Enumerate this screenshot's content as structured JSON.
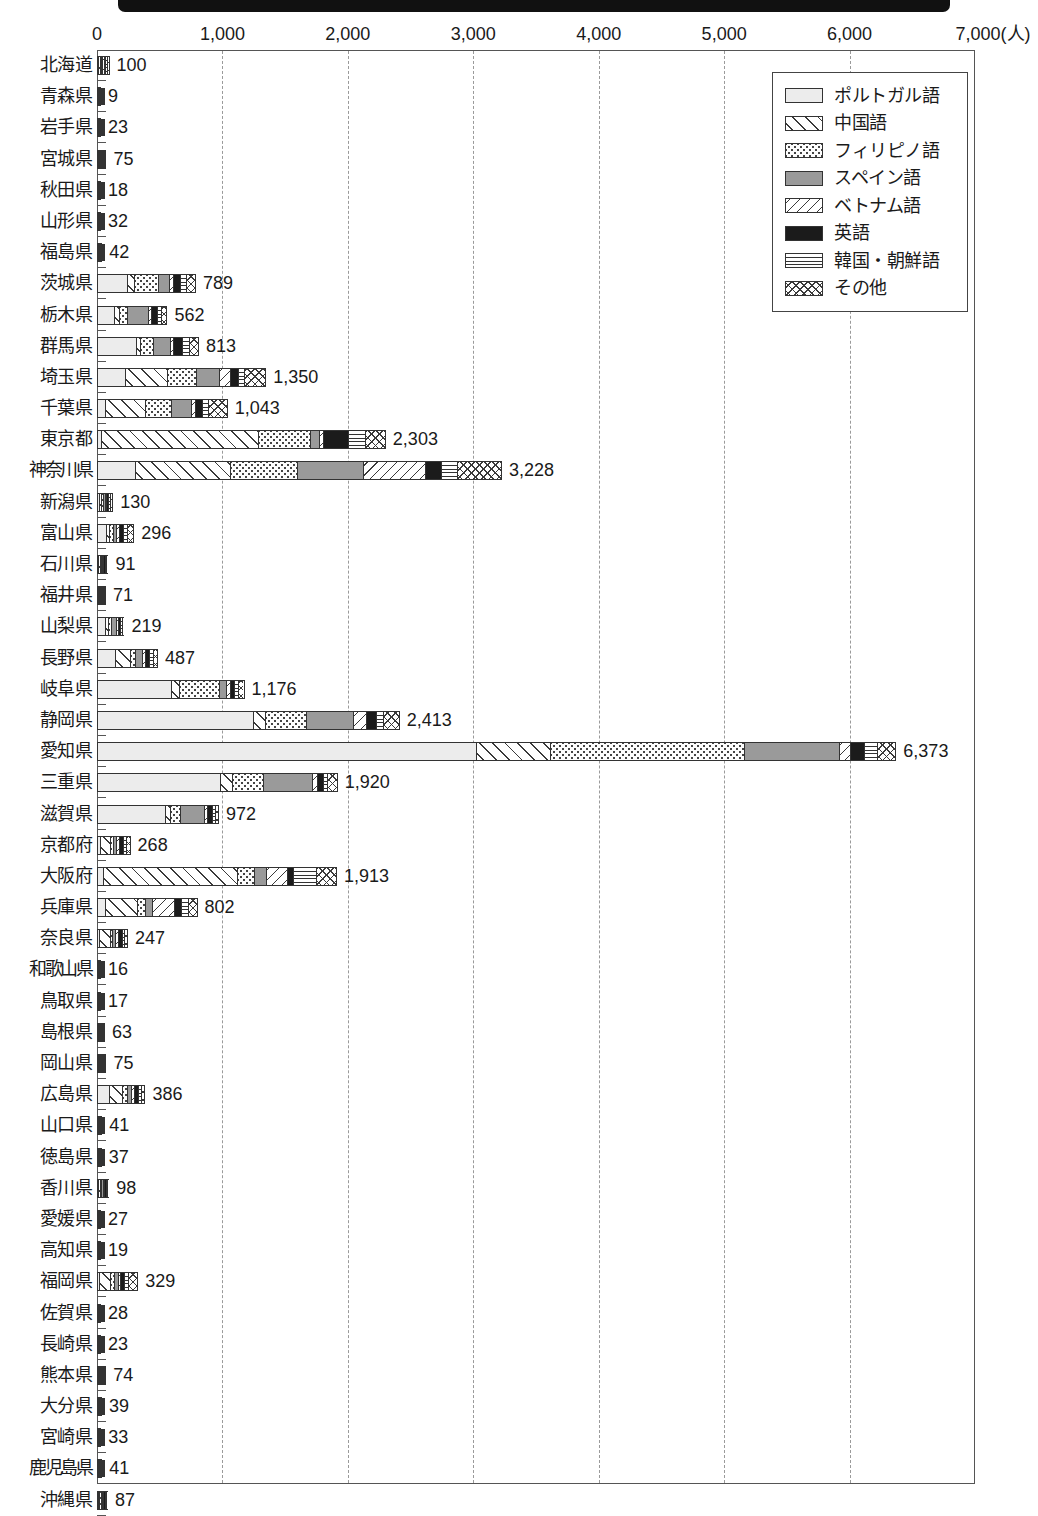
{
  "chart_data": {
    "type": "bar",
    "orientation": "horizontal",
    "stacked": true,
    "title": "",
    "xlabel": "(人)",
    "ylabel": "",
    "xlim": [
      0,
      7000
    ],
    "xticks": [
      0,
      1000,
      2000,
      3000,
      4000,
      5000,
      6000,
      7000
    ],
    "xtick_labels": [
      "0",
      "1,000",
      "2,000",
      "3,000",
      "4,000",
      "5,000",
      "6,000",
      "7,000"
    ],
    "unit_suffix": "(人)",
    "grid": "vertical-dashed",
    "legend_position": "top-right",
    "legend_entries": [
      "ポルトガル語",
      "中国語",
      "フィリピノ語",
      "スペイン語",
      "ベトナム語",
      "英語",
      "韓国・朝鮮語",
      "その他"
    ],
    "series": [
      {
        "key": "pt",
        "name": "ポルトガル語",
        "pattern": "light-gray-solid"
      },
      {
        "key": "zh",
        "name": "中国語",
        "pattern": "diagonal-hatch-up"
      },
      {
        "key": "ph",
        "name": "フィリピノ語",
        "pattern": "dotted"
      },
      {
        "key": "es",
        "name": "スペイン語",
        "pattern": "mid-gray-solid"
      },
      {
        "key": "vi",
        "name": "ベトナム語",
        "pattern": "diagonal-hatch-down"
      },
      {
        "key": "en",
        "name": "英語",
        "pattern": "black-solid"
      },
      {
        "key": "ko",
        "name": "韓国・朝鮮語",
        "pattern": "horizontal-lines"
      },
      {
        "key": "ot",
        "name": "その他",
        "pattern": "cross-hatch"
      }
    ],
    "categories": [
      "北海道",
      "青森県",
      "岩手県",
      "宮城県",
      "秋田県",
      "山形県",
      "福島県",
      "茨城県",
      "栃木県",
      "群馬県",
      "埼玉県",
      "千葉県",
      "東京都",
      "神奈川県",
      "新潟県",
      "富山県",
      "石川県",
      "福井県",
      "山梨県",
      "長野県",
      "岐阜県",
      "静岡県",
      "愛知県",
      "三重県",
      "滋賀県",
      "京都府",
      "大阪府",
      "兵庫県",
      "奈良県",
      "和歌山県",
      "鳥取県",
      "島根県",
      "岡山県",
      "広島県",
      "山口県",
      "徳島県",
      "香川県",
      "愛媛県",
      "高知県",
      "福岡県",
      "佐賀県",
      "長崎県",
      "熊本県",
      "大分県",
      "宮崎県",
      "鹿児島県",
      "沖縄県"
    ],
    "totals": [
      100,
      9,
      23,
      75,
      18,
      32,
      42,
      789,
      562,
      813,
      1350,
      1043,
      2303,
      3228,
      130,
      296,
      91,
      71,
      219,
      487,
      1176,
      2413,
      6373,
      1920,
      972,
      268,
      1913,
      802,
      247,
      16,
      17,
      63,
      75,
      386,
      41,
      37,
      98,
      27,
      19,
      329,
      28,
      23,
      74,
      39,
      33,
      41,
      87
    ],
    "total_labels": [
      "100",
      "9",
      "23",
      "75",
      "18",
      "32",
      "42",
      "789",
      "562",
      "813",
      "1,350",
      "1,043",
      "2,303",
      "3,228",
      "130",
      "296",
      "91",
      "71",
      "219",
      "487",
      "1,176",
      "2,413",
      "6,373",
      "1,920",
      "972",
      "268",
      "1,913",
      "802",
      "247",
      "16",
      "17",
      "63",
      "75",
      "386",
      "41",
      "37",
      "98",
      "27",
      "19",
      "329",
      "28",
      "23",
      "74",
      "39",
      "33",
      "41",
      "87"
    ],
    "rows": [
      {
        "label": "北海道",
        "total": 100,
        "total_label": "100",
        "segments": [
          10,
          10,
          10,
          10,
          6,
          18,
          16,
          20
        ]
      },
      {
        "label": "青森県",
        "total": 9,
        "total_label": "9",
        "segments": [
          1,
          1,
          1,
          1,
          1,
          2,
          1,
          1
        ]
      },
      {
        "label": "岩手県",
        "total": 23,
        "total_label": "23",
        "segments": [
          2,
          2,
          2,
          3,
          2,
          6,
          3,
          3
        ]
      },
      {
        "label": "宮城県",
        "total": 75,
        "total_label": "75",
        "segments": [
          6,
          8,
          8,
          8,
          5,
          18,
          10,
          12
        ]
      },
      {
        "label": "秋田県",
        "total": 18,
        "total_label": "18",
        "segments": [
          1,
          2,
          2,
          2,
          1,
          6,
          2,
          2
        ]
      },
      {
        "label": "山形県",
        "total": 32,
        "total_label": "32",
        "segments": [
          3,
          4,
          4,
          4,
          2,
          8,
          4,
          3
        ]
      },
      {
        "label": "福島県",
        "total": 42,
        "total_label": "42",
        "segments": [
          4,
          5,
          5,
          5,
          3,
          10,
          5,
          5
        ]
      },
      {
        "label": "茨城県",
        "total": 789,
        "total_label": "789",
        "segments": [
          250,
          60,
          200,
          90,
          25,
          50,
          40,
          74
        ]
      },
      {
        "label": "栃木県",
        "total": 562,
        "total_label": "562",
        "segments": [
          150,
          30,
          70,
          180,
          20,
          40,
          30,
          42
        ]
      },
      {
        "label": "群馬県",
        "total": 813,
        "total_label": "813",
        "segments": [
          330,
          30,
          100,
          140,
          20,
          75,
          50,
          68
        ]
      },
      {
        "label": "埼玉県",
        "total": 1350,
        "total_label": "1,350",
        "segments": [
          230,
          340,
          240,
          180,
          90,
          60,
          40,
          170
        ]
      },
      {
        "label": "千葉県",
        "total": 1043,
        "total_label": "1,043",
        "segments": [
          60,
          330,
          220,
          160,
          30,
          50,
          40,
          153
        ]
      },
      {
        "label": "東京都",
        "total": 2303,
        "total_label": "2,303",
        "segments": [
          25,
          1280,
          420,
          70,
          25,
          200,
          130,
          153
        ]
      },
      {
        "label": "神奈川県",
        "total": 3228,
        "total_label": "3,228",
        "segments": [
          300,
          770,
          540,
          530,
          490,
          130,
          120,
          348
        ]
      },
      {
        "label": "新潟県",
        "total": 130,
        "total_label": "130",
        "segments": [
          12,
          18,
          16,
          18,
          8,
          20,
          18,
          20
        ]
      },
      {
        "label": "富山県",
        "total": 296,
        "total_label": "296",
        "segments": [
          80,
          25,
          30,
          25,
          15,
          40,
          30,
          51
        ]
      },
      {
        "label": "石川県",
        "total": 91,
        "total_label": "91",
        "segments": [
          10,
          12,
          12,
          12,
          6,
          18,
          10,
          11
        ]
      },
      {
        "label": "福井県",
        "total": 71,
        "total_label": "71",
        "segments": [
          8,
          10,
          10,
          10,
          5,
          14,
          7,
          7
        ]
      },
      {
        "label": "山梨県",
        "total": 219,
        "total_label": "219",
        "segments": [
          80,
          25,
          25,
          45,
          10,
          15,
          9,
          10
        ]
      },
      {
        "label": "長野県",
        "total": 487,
        "total_label": "487",
        "segments": [
          160,
          130,
          40,
          50,
          20,
          30,
          25,
          32
        ]
      },
      {
        "label": "岐阜県",
        "total": 1176,
        "total_label": "1,176",
        "segments": [
          620,
          60,
          330,
          50,
          25,
          30,
          25,
          36
        ]
      },
      {
        "label": "静岡県",
        "total": 2413,
        "total_label": "2,413",
        "segments": [
          1270,
          90,
          330,
          380,
          100,
          70,
          50,
          123
        ]
      },
      {
        "label": "愛知県",
        "total": 6373,
        "total_label": "6,373",
        "segments": [
          3050,
          590,
          1550,
          760,
          80,
          110,
          90,
          143
        ]
      },
      {
        "label": "三重県",
        "total": 1920,
        "total_label": "1,920",
        "segments": [
          1010,
          90,
          250,
          400,
          30,
          40,
          30,
          70
        ]
      },
      {
        "label": "滋賀県",
        "total": 972,
        "total_label": "972",
        "segments": [
          580,
          35,
          70,
          200,
          20,
          35,
          16,
          16
        ]
      },
      {
        "label": "京都府",
        "total": 268,
        "total_label": "268",
        "segments": [
          20,
          100,
          20,
          25,
          15,
          40,
          20,
          28
        ]
      },
      {
        "label": "大阪府",
        "total": 1913,
        "total_label": "1,913",
        "segments": [
          45,
          1100,
          130,
          90,
          170,
          40,
          180,
          158
        ]
      },
      {
        "label": "兵庫県",
        "total": 802,
        "total_label": "802",
        "segments": [
          60,
          270,
          60,
          60,
          180,
          50,
          60,
          62
        ]
      },
      {
        "label": "奈良県",
        "total": 247,
        "total_label": "247",
        "segments": [
          10,
          110,
          20,
          20,
          15,
          35,
          20,
          17
        ]
      },
      {
        "label": "和歌山県",
        "total": 16,
        "total_label": "16",
        "segments": [
          1,
          2,
          2,
          2,
          1,
          5,
          2,
          1
        ]
      },
      {
        "label": "鳥取県",
        "total": 17,
        "total_label": "17",
        "segments": [
          1,
          2,
          2,
          2,
          1,
          5,
          2,
          2
        ]
      },
      {
        "label": "島根県",
        "total": 63,
        "total_label": "63",
        "segments": [
          8,
          8,
          8,
          8,
          5,
          14,
          6,
          6
        ]
      },
      {
        "label": "岡山県",
        "total": 75,
        "total_label": "75",
        "segments": [
          8,
          10,
          10,
          10,
          5,
          16,
          8,
          8
        ]
      },
      {
        "label": "広島県",
        "total": 386,
        "total_label": "386",
        "segments": [
          110,
          120,
          30,
          30,
          20,
          30,
          20,
          26
        ]
      },
      {
        "label": "山口県",
        "total": 41,
        "total_label": "41",
        "segments": [
          4,
          5,
          5,
          5,
          3,
          10,
          5,
          4
        ]
      },
      {
        "label": "徳島県",
        "total": 37,
        "total_label": "37",
        "segments": [
          3,
          4,
          4,
          4,
          3,
          10,
          5,
          4
        ]
      },
      {
        "label": "香川県",
        "total": 98,
        "total_label": "98",
        "segments": [
          10,
          14,
          14,
          14,
          7,
          20,
          10,
          9
        ]
      },
      {
        "label": "愛媛県",
        "total": 27,
        "total_label": "27",
        "segments": [
          2,
          3,
          3,
          3,
          2,
          8,
          3,
          3
        ]
      },
      {
        "label": "高知県",
        "total": 19,
        "total_label": "19",
        "segments": [
          2,
          2,
          2,
          2,
          1,
          6,
          2,
          2
        ]
      },
      {
        "label": "福岡県",
        "total": 329,
        "total_label": "329",
        "segments": [
          15,
          100,
          30,
          25,
          15,
          30,
          25,
          89
        ]
      },
      {
        "label": "佐賀県",
        "total": 28,
        "total_label": "28",
        "segments": [
          2,
          3,
          3,
          3,
          2,
          8,
          4,
          3
        ]
      },
      {
        "label": "長崎県",
        "total": 23,
        "total_label": "23",
        "segments": [
          2,
          2,
          3,
          3,
          2,
          6,
          3,
          2
        ]
      },
      {
        "label": "熊本県",
        "total": 74,
        "total_label": "74",
        "segments": [
          8,
          14,
          10,
          10,
          5,
          12,
          8,
          7
        ]
      },
      {
        "label": "大分県",
        "total": 39,
        "total_label": "39",
        "segments": [
          3,
          5,
          5,
          5,
          3,
          9,
          5,
          4
        ]
      },
      {
        "label": "宮崎県",
        "total": 33,
        "total_label": "33",
        "segments": [
          3,
          4,
          4,
          4,
          2,
          9,
          4,
          3
        ]
      },
      {
        "label": "鹿児島県",
        "total": 41,
        "total_label": "41",
        "segments": [
          4,
          5,
          5,
          5,
          3,
          10,
          5,
          4
        ]
      },
      {
        "label": "沖縄県",
        "total": 87,
        "total_label": "87",
        "segments": [
          8,
          10,
          10,
          10,
          6,
          25,
          10,
          8
        ]
      }
    ]
  }
}
